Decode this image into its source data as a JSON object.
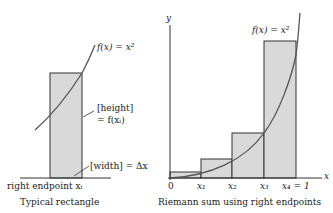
{
  "left_panel": {
    "curve_label": "f(x) = x²",
    "height_label_line1": "[height]",
    "height_label_line2": "= f(xᵢ)",
    "width_label": "[width] = Δx",
    "endpoint_label": "right endpoint xᵢ",
    "caption": "Typical rectangle"
  },
  "right_panel": {
    "y_axis_label": "y",
    "x_axis_label": "x",
    "curve_label": "f(x) = x²",
    "ticks": [
      "0",
      "x₁",
      "x₂",
      "x₃",
      "x₄ = 1"
    ],
    "caption": "Riemann sum using right endpoints"
  },
  "colors": {
    "rect_fill": "#d9d9d9",
    "stroke": "#333333",
    "curve": "#555555"
  }
}
